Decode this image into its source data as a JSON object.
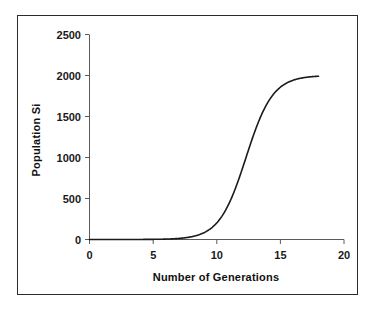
{
  "chart_data": {
    "type": "line",
    "title": "",
    "xlabel": "Number of Generations",
    "ylabel": "Population Si",
    "xlim": [
      0,
      20
    ],
    "ylim": [
      0,
      2500
    ],
    "xticks": [
      "0",
      "5",
      "10",
      "15",
      "20"
    ],
    "xtick_values": [
      0,
      5,
      10,
      15,
      20
    ],
    "yticks": [
      "0",
      "500",
      "1000",
      "1500",
      "2000",
      "2500"
    ],
    "ytick_values": [
      0,
      500,
      1000,
      1500,
      2000,
      2500
    ],
    "grid": false,
    "legend": null,
    "legend_position": "none",
    "series": [
      {
        "name": "Population Size",
        "x": [
          0,
          0.5,
          1,
          1.5,
          2,
          2.5,
          3,
          3.5,
          4,
          4.5,
          5,
          5.5,
          6,
          6.5,
          7,
          7.5,
          8,
          8.5,
          9,
          9.5,
          10,
          10.5,
          11,
          11.5,
          12,
          12.5,
          13,
          13.5,
          14,
          14.5,
          15,
          15.5,
          16,
          16.5,
          17,
          17.5,
          18
        ],
        "values": [
          2,
          3,
          4,
          5,
          7,
          9,
          12,
          15,
          20,
          26,
          34,
          44,
          57,
          74,
          95,
          122,
          156,
          199,
          253,
          319,
          400,
          497,
          611,
          742,
          886,
          1037,
          1186,
          1325,
          1446,
          1546,
          1626,
          1687,
          1733,
          1768,
          1793,
          1811,
          1824
        ]
      }
    ],
    "curve_model": {
      "type": "logistic",
      "carrying_capacity": 2000,
      "midpoint_generation": 12.3,
      "growth_rate": 0.95,
      "plateau_value": 1985,
      "x_start": 0,
      "x_end": 18
    }
  },
  "axis": {
    "y_title": "Population Si",
    "x_title": "Number of Generations"
  }
}
